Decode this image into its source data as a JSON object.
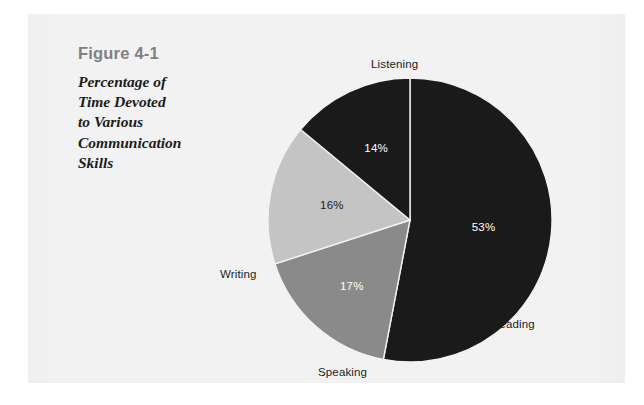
{
  "figure": {
    "number": "Figure 4-1",
    "title": "Percentage of Time Devoted to Various Communication Skills",
    "title_line1": "Percentage of",
    "title_line2": "Time Devoted",
    "title_line3": "to Various",
    "title_line4": "Communication",
    "title_line5": "Skills"
  },
  "colors": {
    "page_background": "#ffffff",
    "panel_background": "#f2f2f2",
    "slice_dark": "#1a1a1a",
    "slice_medium_gray": "#8a8a8a",
    "slice_light_gray": "#c4c4c4",
    "label_dark": "#1c1c1c",
    "label_light": "#ffffff",
    "figure_number": "#808080"
  },
  "labels": {
    "listening": "Listening",
    "reading": "Reading",
    "speaking": "Speaking",
    "writing": "Writing"
  },
  "percent_labels": {
    "listening": "53%",
    "reading": "17%",
    "speaking": "16%",
    "writing": "14%"
  },
  "chart_data": {
    "type": "pie",
    "title": "Percentage of Time Devoted to Various Communication Skills",
    "xlabel": "",
    "ylabel": "",
    "legend_position": "outside-labels",
    "grid": false,
    "start_angle_deg": 0,
    "direction": "clockwise",
    "units": "percent",
    "total": 100,
    "categories": [
      "Listening",
      "Reading",
      "Speaking",
      "Writing"
    ],
    "values": [
      53,
      17,
      16,
      14
    ],
    "slice_colors": [
      "#1a1a1a",
      "#8a8a8a",
      "#c4c4c4",
      "#1a1a1a"
    ],
    "data_labels": [
      "53%",
      "17%",
      "16%",
      "14%"
    ],
    "data_label_colors": [
      "#ffffff",
      "#ffffff",
      "#1c1c1c",
      "#ffffff"
    ],
    "slices": [
      {
        "label": "Listening",
        "value": 53,
        "data_label": "53%",
        "color": "#1a1a1a",
        "label_color": "#ffffff"
      },
      {
        "label": "Reading",
        "value": 17,
        "data_label": "17%",
        "color": "#8a8a8a",
        "label_color": "#ffffff"
      },
      {
        "label": "Speaking",
        "value": 16,
        "data_label": "16%",
        "color": "#c4c4c4",
        "label_color": "#1c1c1c"
      },
      {
        "label": "Writing",
        "value": 14,
        "data_label": "14%",
        "color": "#1a1a1a",
        "label_color": "#ffffff"
      }
    ]
  }
}
